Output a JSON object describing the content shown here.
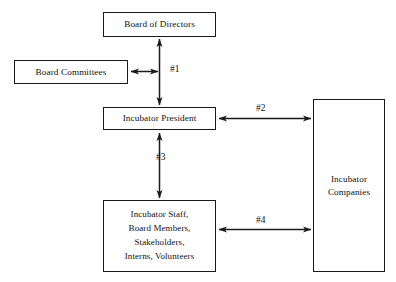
{
  "diagram": {
    "type": "org-flow",
    "background_color": "#ffffff",
    "stroke_color": "#1a1a1a",
    "text_color": "#111111",
    "nodes": [
      {
        "id": "board-of-directors",
        "lines": [
          "Board of Directors"
        ],
        "x": 103,
        "y": 12,
        "w": 113,
        "h": 25
      },
      {
        "id": "board-committees",
        "lines": [
          "Board Committees"
        ],
        "x": 14,
        "y": 60,
        "w": 114,
        "h": 24
      },
      {
        "id": "incubator-president",
        "lines": [
          "Incubator President"
        ],
        "x": 103,
        "y": 107,
        "w": 113,
        "h": 23
      },
      {
        "id": "incubator-staff",
        "lines": [
          "Incubator Staff,",
          "Board Members,",
          "Stakeholders,",
          "Interns, Volunteers"
        ],
        "x": 103,
        "y": 200,
        "w": 113,
        "h": 72
      },
      {
        "id": "incubator-companies",
        "lines": [
          "Incubator",
          "Companies"
        ],
        "x": 313,
        "y": 99,
        "w": 72,
        "h": 173
      }
    ],
    "edges": [
      {
        "id": "edge-1",
        "label": "#1",
        "from": "board-of-directors",
        "to": "incubator-president",
        "branch_from": "board-committees",
        "direction": "bidirectional",
        "orientation": "vertical"
      },
      {
        "id": "edge-2",
        "label": "#2",
        "from": "incubator-president",
        "to": "incubator-companies",
        "direction": "bidirectional",
        "orientation": "horizontal"
      },
      {
        "id": "edge-3",
        "label": "#3",
        "from": "incubator-president",
        "to": "incubator-staff",
        "direction": "bidirectional",
        "orientation": "vertical"
      },
      {
        "id": "edge-4",
        "label": "#4",
        "from": "incubator-staff",
        "to": "incubator-companies",
        "direction": "bidirectional",
        "orientation": "horizontal"
      }
    ]
  }
}
